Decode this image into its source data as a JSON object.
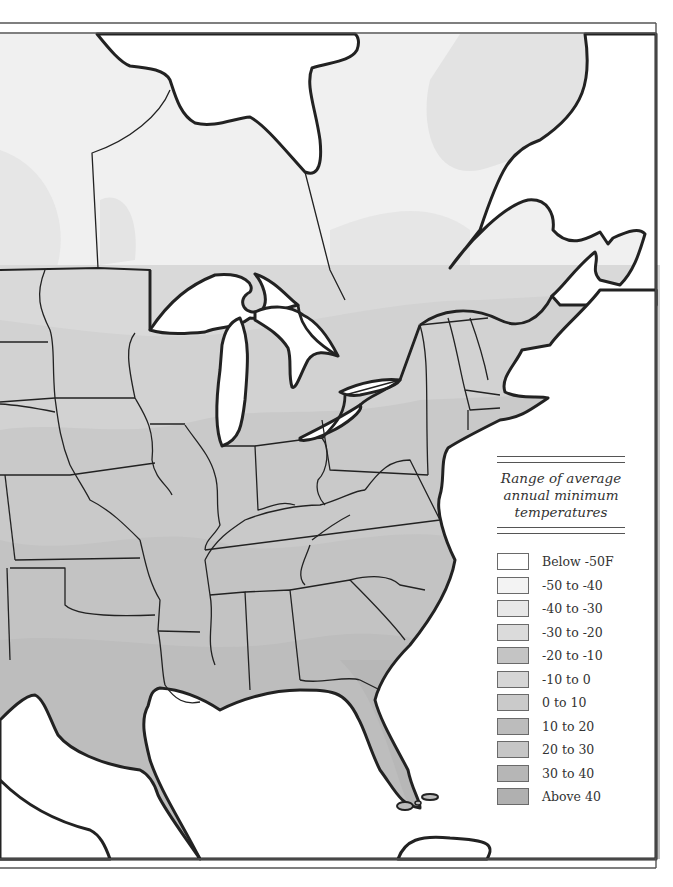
{
  "figure": {
    "type": "choropleth-map",
    "region": "Eastern North America",
    "style": "greyscale"
  },
  "legend": {
    "title_lines": [
      "Range of average",
      "annual minimum",
      "temperatures"
    ],
    "items": [
      {
        "label": "Below -50F",
        "color": "#ffffff"
      },
      {
        "label": "-50 to -40",
        "color": "#f3f3f3"
      },
      {
        "label": "-40 to -30",
        "color": "#e8e8e8"
      },
      {
        "label": "-30 to -20",
        "color": "#dbdbdb"
      },
      {
        "label": "-20 to -10",
        "color": "#c4c4c4"
      },
      {
        "label": "-10 to 0",
        "color": "#d6d6d6"
      },
      {
        "label": "0 to 10",
        "color": "#cacaca"
      },
      {
        "label": "10 to 20",
        "color": "#bcbcbc"
      },
      {
        "label": "20 to 30",
        "color": "#c6c6c6"
      },
      {
        "label": "30 to 40",
        "color": "#b6b6b6"
      },
      {
        "label": "Above 40",
        "color": "#b0b0b0"
      }
    ]
  },
  "colors": {
    "water": "#ffffff",
    "border_line": "#222222",
    "frame_line": "#555555"
  }
}
